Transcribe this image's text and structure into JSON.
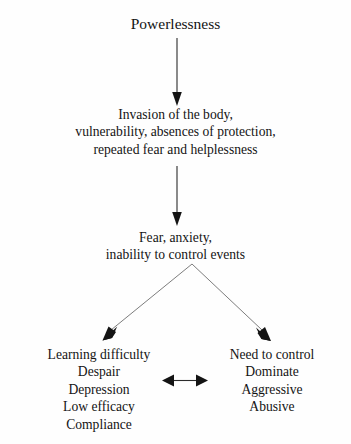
{
  "diagram": {
    "title_text": "Powerlessness",
    "background_color": "#fefefe",
    "text_color": "#141414",
    "nodes": {
      "powerlessness": {
        "lines": [
          "Powerlessness"
        ]
      },
      "invasion": {
        "lines": [
          "Invasion of the body,",
          "vulnerability, absences of protection,",
          "repeated fear and helplessness"
        ]
      },
      "fear": {
        "lines": [
          "Fear, anxiety,",
          "inability to control events"
        ]
      },
      "learning_difficulty": {
        "lines": [
          "Learning difficulty",
          "Despair",
          "Depression",
          "Low efficacy",
          "Compliance"
        ]
      },
      "need_to_control": {
        "lines": [
          "Need to control",
          "Dominate",
          "Aggressive",
          "Abusive"
        ]
      }
    },
    "connectors": [
      {
        "name": "powerlessness-to-invasion",
        "kind": "vertical-arrow",
        "direction": "down"
      },
      {
        "name": "invasion-to-fear",
        "kind": "vertical-arrow",
        "direction": "down"
      },
      {
        "name": "fear-to-learning-difficulty",
        "kind": "branch-arrow",
        "direction": "down-left"
      },
      {
        "name": "fear-to-need-to-control",
        "kind": "branch-arrow",
        "direction": "down-right"
      },
      {
        "name": "learning-difficulty-to-need-to-control",
        "kind": "double-headed-arrow",
        "direction": "bidirectional"
      }
    ]
  }
}
